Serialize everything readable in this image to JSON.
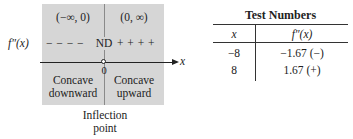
{
  "sign_chart": {
    "intervals": [
      {
        "label": "(−∞, 0)",
        "concavity_line1": "Concave",
        "concavity_line2": "downward"
      },
      {
        "label": "(0, ∞)",
        "concavity_line1": "Concave",
        "concavity_line2": "upward"
      }
    ],
    "row_label": "f″(x)",
    "sign_row_left": "− − − −",
    "sign_row_center": "ND",
    "sign_row_right": "+ + + +",
    "axis_label": "x",
    "critical_value": "0",
    "annotation_line1": "Inflection",
    "annotation_line2": "point",
    "shade_color": "#d6d6d6"
  },
  "table": {
    "title": "Test Numbers",
    "headers": [
      "x",
      "f″(x)"
    ],
    "rows": [
      [
        "−8",
        "−1.67 (−)"
      ],
      [
        "8",
        "1.67 (+)"
      ]
    ]
  }
}
